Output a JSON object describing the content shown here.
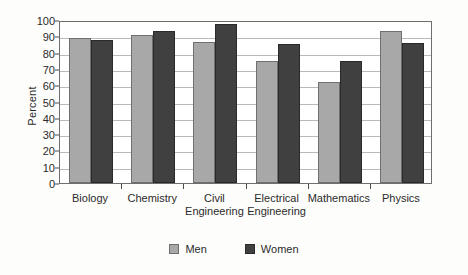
{
  "chart_data": {
    "type": "bar",
    "title": "",
    "xlabel": "",
    "ylabel": "Percent",
    "ylim": [
      0,
      100
    ],
    "ytick_step": 10,
    "yticks": [
      0,
      10,
      20,
      30,
      40,
      50,
      60,
      70,
      80,
      90,
      100
    ],
    "grid": true,
    "legend_position": "bottom",
    "categories": [
      "Biology",
      "Chemistry",
      "Civil\nEngineering",
      "Electrical\nEngineering",
      "Mathematics",
      "Physics"
    ],
    "series": [
      {
        "name": "Men",
        "color": "#a8a8a8",
        "values": [
          89,
          91,
          86.5,
          75,
          62,
          93
        ]
      },
      {
        "name": "Women",
        "color": "#404040",
        "values": [
          87.5,
          93.5,
          97.5,
          85,
          75,
          86
        ]
      }
    ]
  },
  "legend": {
    "items": [
      {
        "label": "Men",
        "swatch": "men-swatch"
      },
      {
        "label": "Women",
        "swatch": "women-swatch"
      }
    ]
  },
  "colors": {
    "men": "#a8a8a8",
    "women": "#404040",
    "gridline": "#b9b9b9",
    "frame": "#6e6e6e",
    "background": "#fdfdfb"
  }
}
